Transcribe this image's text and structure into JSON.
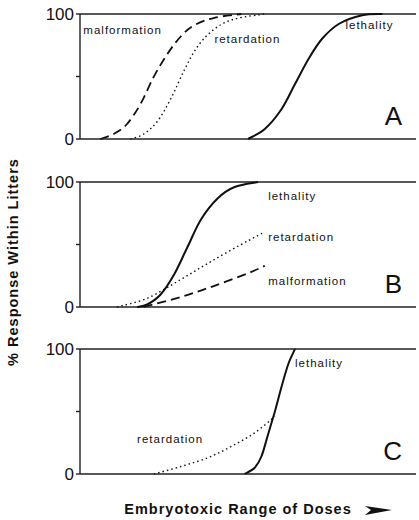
{
  "chart_data": {
    "type": "line",
    "ylabel": "% Response Within Litters",
    "xlabel": "Embryotoxic Range of Doses",
    "xlabel_arrow": "➤",
    "y_ticks": [
      "0",
      "100"
    ],
    "ylim": [
      0,
      100
    ],
    "x_units": "relative dose (0–100, unlabeled)",
    "grid": false,
    "panels": [
      {
        "letter": "A",
        "series": [
          {
            "name": "malformation",
            "style": "dashed",
            "points": [
              [
                6,
                0
              ],
              [
                10,
                4
              ],
              [
                14,
                12
              ],
              [
                18,
                28
              ],
              [
                22,
                50
              ],
              [
                26,
                68
              ],
              [
                30,
                82
              ],
              [
                34,
                91
              ],
              [
                40,
                97
              ],
              [
                48,
                100
              ]
            ],
            "label_pos": [
              1,
              84
            ]
          },
          {
            "name": "retardation",
            "style": "dotted",
            "points": [
              [
                15,
                0
              ],
              [
                19,
                4
              ],
              [
                23,
                14
              ],
              [
                27,
                32
              ],
              [
                31,
                55
              ],
              [
                35,
                74
              ],
              [
                40,
                88
              ],
              [
                46,
                96
              ],
              [
                55,
                100
              ]
            ],
            "label_pos": [
              40,
              77
            ]
          },
          {
            "name": "lethality",
            "style": "solid",
            "points": [
              [
                50,
                0
              ],
              [
                55,
                8
              ],
              [
                60,
                24
              ],
              [
                64,
                44
              ],
              [
                68,
                64
              ],
              [
                72,
                80
              ],
              [
                77,
                92
              ],
              [
                84,
                99
              ],
              [
                90,
                100
              ]
            ],
            "label_pos": [
              79,
              88
            ]
          }
        ]
      },
      {
        "letter": "B",
        "series": [
          {
            "name": "lethality",
            "style": "solid",
            "points": [
              [
                17,
                0
              ],
              [
                20,
                2
              ],
              [
                24,
                10
              ],
              [
                28,
                26
              ],
              [
                32,
                48
              ],
              [
                36,
                70
              ],
              [
                41,
                87
              ],
              [
                46,
                96
              ],
              [
                53,
                100
              ]
            ],
            "label_pos": [
              56,
              86
            ]
          },
          {
            "name": "retardation",
            "style": "dotted",
            "points": [
              [
                11,
                0
              ],
              [
                20,
                7
              ],
              [
                30,
                22
              ],
              [
                40,
                38
              ],
              [
                50,
                53
              ],
              [
                55,
                60
              ]
            ],
            "label_pos": [
              56,
              53
            ]
          },
          {
            "name": "malformation",
            "style": "dashed",
            "points": [
              [
                19,
                0
              ],
              [
                30,
                8
              ],
              [
                40,
                17
              ],
              [
                50,
                27
              ],
              [
                55,
                33
              ]
            ],
            "label_pos": [
              56,
              18
            ]
          }
        ]
      },
      {
        "letter": "C",
        "series": [
          {
            "name": "retardation",
            "style": "dotted",
            "points": [
              [
                22,
                0
              ],
              [
                30,
                6
              ],
              [
                38,
                13
              ],
              [
                45,
                22
              ],
              [
                52,
                33
              ],
              [
                58,
                46
              ]
            ],
            "label_pos": [
              17,
              25
            ]
          },
          {
            "name": "lethality",
            "style": "solid",
            "points": [
              [
                49,
                0
              ],
              [
                52,
                5
              ],
              [
                54,
                14
              ],
              [
                56,
                32
              ],
              [
                58,
                50
              ],
              [
                60,
                70
              ],
              [
                62,
                88
              ],
              [
                64,
                100
              ]
            ],
            "label_pos": [
              64,
              86
            ]
          }
        ]
      }
    ]
  }
}
